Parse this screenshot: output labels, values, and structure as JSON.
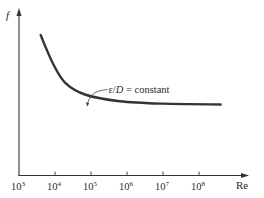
{
  "chart_data": {
    "type": "line",
    "title": "",
    "xlabel": "Re",
    "ylabel": "f",
    "xscale": "log",
    "xlim_exponent": [
      3,
      9
    ],
    "x_ticks": [
      {
        "base": "10",
        "exp": "3",
        "value": 1000
      },
      {
        "base": "10",
        "exp": "4",
        "value": 10000
      },
      {
        "base": "10",
        "exp": "5",
        "value": 100000
      },
      {
        "base": "10",
        "exp": "6",
        "value": 1000000
      },
      {
        "base": "10",
        "exp": "7",
        "value": 10000000
      },
      {
        "base": "10",
        "exp": "8",
        "value": 100000000
      }
    ],
    "y_ticks": [],
    "ylim": [
      0,
      1
    ],
    "grid": false,
    "series": [
      {
        "name": "ε/D = constant",
        "color": "#333333",
        "points": [
          {
            "log10_re": 3.6,
            "f_rel": 0.87
          },
          {
            "log10_re": 3.95,
            "f_rel": 0.69
          },
          {
            "log10_re": 4.3,
            "f_rel": 0.57
          },
          {
            "log10_re": 4.85,
            "f_rel": 0.5
          },
          {
            "log10_re": 5.8,
            "f_rel": 0.46
          },
          {
            "log10_re": 7.0,
            "f_rel": 0.445
          },
          {
            "log10_re": 8.6,
            "f_rel": 0.44
          }
        ]
      }
    ],
    "annotations": [
      {
        "text_prefix": "ε/",
        "text_italic": "D",
        "text_suffix": " = constant",
        "points_to_log10_re": 4.9
      }
    ]
  }
}
